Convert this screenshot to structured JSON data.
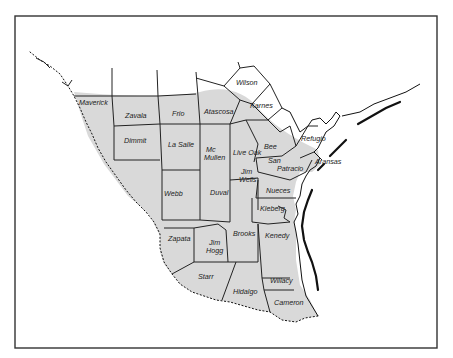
{
  "map": {
    "title": "",
    "shade_color": "#d9d9d9",
    "line_color": "#222222",
    "background": "#ffffff",
    "counties": [
      {
        "name": "Wilson",
        "x": 236,
        "y": 85
      },
      {
        "name": "Karnes",
        "x": 250,
        "y": 108
      },
      {
        "name": "Maverick",
        "x": 79,
        "y": 105
      },
      {
        "name": "Zavala",
        "x": 125,
        "y": 118
      },
      {
        "name": "Frio",
        "x": 172,
        "y": 116
      },
      {
        "name": "Atascosa",
        "x": 204,
        "y": 114
      },
      {
        "name": "Refugio",
        "x": 301,
        "y": 141
      },
      {
        "name": "Dimmit",
        "x": 124,
        "y": 143
      },
      {
        "name": "La Salle",
        "x": 168,
        "y": 147
      },
      {
        "name": "Mc",
        "x": 206,
        "y": 152
      },
      {
        "name": "Mullen",
        "x": 204,
        "y": 160
      },
      {
        "name": "Live Oak",
        "x": 233,
        "y": 155
      },
      {
        "name": "Bee",
        "x": 264,
        "y": 149
      },
      {
        "name": "San",
        "x": 268,
        "y": 163
      },
      {
        "name": "Patracio",
        "x": 277,
        "y": 171
      },
      {
        "name": "Aransas",
        "x": 315,
        "y": 164
      },
      {
        "name": "Jim",
        "x": 241,
        "y": 174
      },
      {
        "name": "Wells",
        "x": 239,
        "y": 182
      },
      {
        "name": "Webb",
        "x": 164,
        "y": 196
      },
      {
        "name": "Duval",
        "x": 210,
        "y": 195
      },
      {
        "name": "Nueces",
        "x": 266,
        "y": 193
      },
      {
        "name": "Kleberg",
        "x": 260,
        "y": 211
      },
      {
        "name": "Zapata",
        "x": 168,
        "y": 241
      },
      {
        "name": "Brooks",
        "x": 233,
        "y": 236
      },
      {
        "name": "Kenedy",
        "x": 265,
        "y": 238
      },
      {
        "name": "Jim",
        "x": 209,
        "y": 245
      },
      {
        "name": "Hogg",
        "x": 206,
        "y": 253
      },
      {
        "name": "Starr",
        "x": 198,
        "y": 279
      },
      {
        "name": "Willacy",
        "x": 270,
        "y": 283
      },
      {
        "name": "Hidalgo",
        "x": 233,
        "y": 294
      },
      {
        "name": "Cameron",
        "x": 274,
        "y": 305
      }
    ]
  }
}
